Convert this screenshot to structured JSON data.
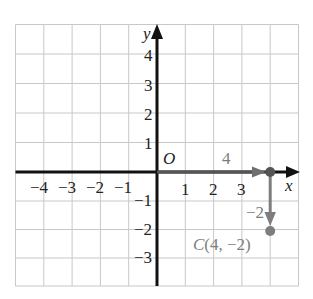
{
  "diagram": {
    "type": "coordinate-plane",
    "x_range": [
      -5,
      5
    ],
    "y_range": [
      -4,
      5
    ],
    "axis_labels": {
      "x": "x",
      "y": "y"
    },
    "origin_label": "O",
    "x_tick_labels": [
      "-4",
      "-3",
      "-2",
      "-1",
      "1",
      "2",
      "3"
    ],
    "y_tick_labels": [
      "4",
      "3",
      "2",
      "1",
      "-1",
      "-2",
      "-3"
    ],
    "translation": {
      "horizontal_label": "4",
      "vertical_label": "-2"
    },
    "point": {
      "name": "C",
      "x": 4,
      "y": -2,
      "label": "C(4, −2)"
    },
    "colors": {
      "axis": "#111111",
      "grid": "#c8c8c8",
      "annotation": "#7d7d7d"
    }
  },
  "labels": {
    "x_axis": "x",
    "y_axis": "y",
    "origin": "O",
    "xt_m4": "−4",
    "xt_m3": "−3",
    "xt_m2": "−2",
    "xt_m1": "−1",
    "xt_1": "1",
    "xt_2": "2",
    "xt_3": "3",
    "yt_4": "4",
    "yt_3": "3",
    "yt_2": "2",
    "yt_1": "1",
    "yt_m1": "−1",
    "yt_m2": "−2",
    "yt_m3": "−3",
    "move_right": "4",
    "move_down": "−2",
    "point_c": "C(4, −2)"
  }
}
